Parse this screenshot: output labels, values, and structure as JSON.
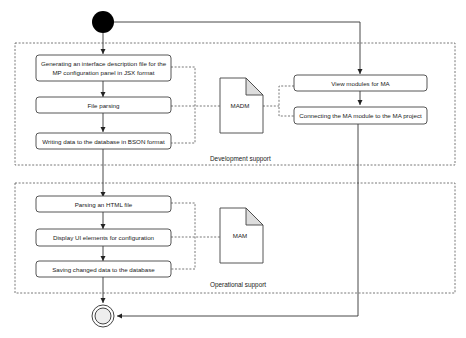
{
  "diagram": {
    "type": "UML activity diagram",
    "frames": [
      {
        "id": "development",
        "label": "Development support"
      },
      {
        "id": "operational",
        "label": "Operational support"
      }
    ],
    "activities": {
      "gen_line1": "Generating an interface description file for the",
      "gen_line2": "MP configuration panel in JSX format",
      "file_parsing": "File parsing",
      "writing_bson": "Writing data to the database in BSON format",
      "view_modules": "View modules for MA",
      "connecting_ma": "Connecting the MA module to the MA project",
      "parsing_html": "Parsing an HTML file",
      "display_ui": "Display UI elements for configuration",
      "saving_data": "Saving changed data to the database"
    },
    "documents": {
      "madm": "MADM",
      "mam": "MAM"
    },
    "nodes": {
      "start": "initial-node",
      "end": "final-node"
    },
    "flows": [
      [
        "start",
        "gen"
      ],
      [
        "gen",
        "file_parsing"
      ],
      [
        "file_parsing",
        "writing_bson"
      ],
      [
        "writing_bson",
        "parsing_html"
      ],
      [
        "parsing_html",
        "display_ui"
      ],
      [
        "display_ui",
        "saving_data"
      ],
      [
        "saving_data",
        "end"
      ],
      [
        "start",
        "view_modules"
      ],
      [
        "view_modules",
        "connecting_ma"
      ],
      [
        "connecting_ma",
        "end"
      ]
    ],
    "dependencies": [
      [
        "gen",
        "madm"
      ],
      [
        "file_parsing",
        "madm"
      ],
      [
        "writing_bson",
        "madm"
      ],
      [
        "madm",
        "view_modules"
      ],
      [
        "madm",
        "connecting_ma"
      ],
      [
        "parsing_html",
        "mam"
      ],
      [
        "display_ui",
        "mam"
      ],
      [
        "saving_data",
        "mam"
      ]
    ]
  }
}
